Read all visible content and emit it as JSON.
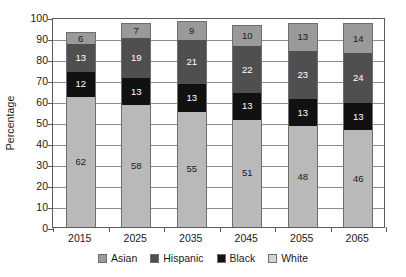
{
  "chart_data": {
    "type": "bar",
    "title": "",
    "subtitle": "",
    "xlabel": "",
    "ylabel": "Percentage",
    "categories": [
      "2015",
      "2025",
      "2035",
      "2045",
      "2055",
      "2065"
    ],
    "ylim": [
      0,
      100
    ],
    "yticks": [
      0,
      10,
      20,
      30,
      40,
      50,
      60,
      70,
      80,
      90,
      100
    ],
    "ytick_labels": [
      "0",
      "10",
      "20",
      "30",
      "40",
      "50",
      "60",
      "70",
      "80",
      "90",
      "100"
    ],
    "grid": true,
    "stacked": true,
    "stack_order_bottom_to_top": [
      "White",
      "Black",
      "Hispanic",
      "Asian"
    ],
    "legend_position": "bottom",
    "legend": [
      "Asian",
      "Hispanic",
      "Black",
      "White"
    ],
    "series": [
      {
        "name": "White",
        "color": "#b9b9b9",
        "values": [
          62,
          58,
          55,
          51,
          48,
          46
        ]
      },
      {
        "name": "Black",
        "color": "#111111",
        "values": [
          12,
          13,
          13,
          13,
          13,
          13
        ]
      },
      {
        "name": "Hispanic",
        "color": "#4f4f4f",
        "values": [
          13,
          19,
          21,
          22,
          23,
          24
        ]
      },
      {
        "name": "Asian",
        "color": "#9a9a9a",
        "values": [
          6,
          7,
          9,
          10,
          13,
          14
        ]
      }
    ],
    "data_labels": {
      "2015": {
        "White": "62",
        "Black": "12",
        "Hispanic": "13",
        "Asian": "6"
      },
      "2025": {
        "White": "58",
        "Black": "13",
        "Hispanic": "19",
        "Asian": "7"
      },
      "2035": {
        "White": "55",
        "Black": "13",
        "Hispanic": "21",
        "Asian": "9"
      },
      "2045": {
        "White": "51",
        "Black": "13",
        "Hispanic": "22",
        "Asian": "10"
      },
      "2055": {
        "White": "48",
        "Black": "13",
        "Hispanic": "23",
        "Asian": "13"
      },
      "2065": {
        "White": "46",
        "Black": "13",
        "Hispanic": "24",
        "Asian": "14"
      }
    }
  },
  "legend_items": [
    {
      "label": "Asian",
      "key": "asian"
    },
    {
      "label": "Hispanic",
      "key": "hispanic"
    },
    {
      "label": "Black",
      "key": "black"
    },
    {
      "label": "White",
      "key": "white"
    }
  ]
}
